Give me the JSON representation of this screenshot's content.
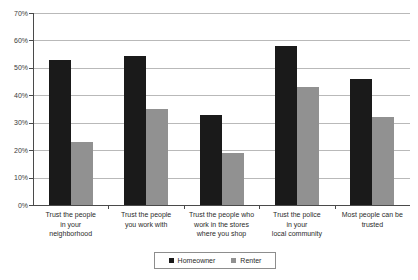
{
  "chart_data": {
    "type": "bar",
    "title": "",
    "subtitle": "",
    "xlabel": "",
    "ylabel": "",
    "ylim": [
      0,
      70
    ],
    "ytick_labels": [
      "0%",
      "10%",
      "20%",
      "30%",
      "40%",
      "50%",
      "60%",
      "70%"
    ],
    "ytick_values": [
      0,
      10,
      20,
      30,
      40,
      50,
      60,
      70
    ],
    "grid": true,
    "legend_position": "bottom",
    "categories": [
      "Trust the people in your neighborhood",
      "Trust the people you work with",
      "Trust the people who work in the stores where you shop",
      "Trust the police in your local community",
      "Most people can be trusted"
    ],
    "category_lines": [
      [
        "Trust the people",
        "in your",
        "neighborhood"
      ],
      [
        "Trust the people",
        "you work with"
      ],
      [
        "Trust the people who",
        "work in the stores",
        "where you shop"
      ],
      [
        "Trust the police",
        "in your",
        "local community"
      ],
      [
        "Most people can be",
        "trusted"
      ]
    ],
    "series": [
      {
        "name": "Homeowner",
        "color": "#1a1a1a",
        "values": [
          53,
          54.5,
          33,
          58,
          46
        ]
      },
      {
        "name": "Renter",
        "color": "#919191",
        "values": [
          23,
          35,
          19,
          43,
          32
        ]
      }
    ]
  },
  "legend": {
    "items": [
      {
        "label": "Homeowner",
        "color": "#1a1a1a"
      },
      {
        "label": "Renter",
        "color": "#919191"
      }
    ]
  }
}
